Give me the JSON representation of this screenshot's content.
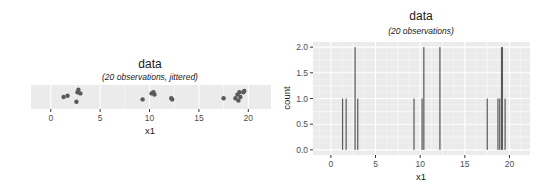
{
  "chart_data": [
    {
      "type": "scatter",
      "title": "data",
      "subtitle": "(20 observations, jittered)",
      "xlabel": "x1",
      "ylabel": "",
      "xlim": [
        -2,
        22.3
      ],
      "xticks": [
        0,
        5,
        10,
        15,
        20
      ],
      "grid": true,
      "x": [
        1.3,
        1.7,
        2.6,
        2.7,
        2.8,
        3.0,
        9.3,
        10.2,
        10.4,
        10.5,
        12.2,
        12.3,
        17.5,
        18.7,
        18.9,
        19.0,
        19.1,
        19.2,
        19.5,
        19.6
      ],
      "jitter_y": [
        0.5,
        0.45,
        0.7,
        0.3,
        0.2,
        0.35,
        0.6,
        0.35,
        0.3,
        0.4,
        0.55,
        0.6,
        0.55,
        0.55,
        0.4,
        0.65,
        0.3,
        0.5,
        0.3,
        0.25
      ]
    },
    {
      "type": "bar",
      "title": "data",
      "subtitle": "(20 observations)",
      "xlabel": "x1",
      "ylabel": "count",
      "xlim": [
        -2,
        22.3
      ],
      "ylim": [
        -0.1,
        2.1
      ],
      "xticks": [
        0,
        5,
        10,
        15,
        20
      ],
      "yticks": [
        "0.0",
        "0.5",
        "1.0",
        "1.5",
        "2.0"
      ],
      "grid": true,
      "x": [
        1.3,
        1.7,
        2.7,
        3.0,
        9.3,
        10.2,
        10.4,
        12.2,
        17.5,
        18.7,
        18.9,
        19.1,
        19.2,
        19.5
      ],
      "counts": [
        1,
        1,
        2,
        1,
        1,
        1,
        2,
        2,
        1,
        1,
        1,
        2,
        2,
        1
      ]
    }
  ],
  "colors": {
    "panel_bg": "#ebebeb",
    "grid_major": "#ffffff",
    "point": "#595959",
    "bar": "#595959"
  }
}
